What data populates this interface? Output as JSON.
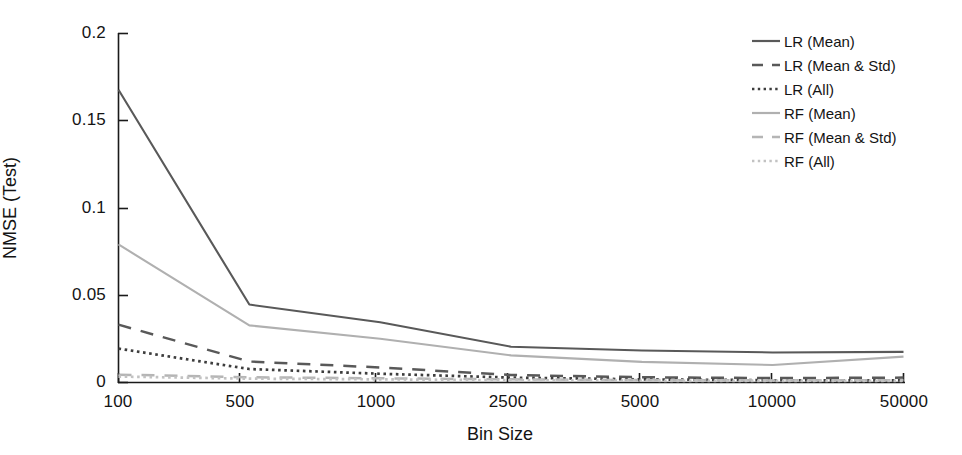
{
  "chart_data": {
    "type": "line",
    "title": "",
    "xlabel": "Bin Size",
    "ylabel": "NMSE (Test)",
    "x_categories": [
      "100",
      "500",
      "1000",
      "2500",
      "5000",
      "10000",
      "50000"
    ],
    "x_tick_labels": [
      "100",
      "500",
      "1000",
      "2500",
      "5000",
      "10000",
      "50000"
    ],
    "y_tick_labels": [
      "0",
      "0.05",
      "0.1",
      "0.15",
      "0.2"
    ],
    "y_tick_values": [
      0,
      0.05,
      0.1,
      0.15,
      0.2
    ],
    "ylim": [
      0,
      0.2
    ],
    "grid": false,
    "legend_position": "top-right",
    "series": [
      {
        "name": "LR (Mean)",
        "style": "solid",
        "color": "#595959",
        "values": [
          0.1675,
          0.0446,
          0.0345,
          0.0205,
          0.0183,
          0.0172,
          0.0175
        ]
      },
      {
        "name": "LR (Mean & Std)",
        "style": "dashed",
        "color": "#595959",
        "values": [
          0.0331,
          0.012,
          0.0086,
          0.0043,
          0.003,
          0.0025,
          0.0028
        ]
      },
      {
        "name": "LR (All)",
        "style": "dotted",
        "color": "#3d3d3d",
        "values": [
          0.0194,
          0.0077,
          0.005,
          0.0028,
          0.0018,
          0.0013,
          0.0012
        ]
      },
      {
        "name": "RF (Mean)",
        "style": "solid",
        "color": "#b0b0b0",
        "values": [
          0.079,
          0.0327,
          0.025,
          0.0155,
          0.0118,
          0.01,
          0.0148
        ]
      },
      {
        "name": "RF (Mean & Std)",
        "style": "dashed",
        "color": "#b5b5b5",
        "values": [
          0.0045,
          0.003,
          0.0024,
          0.0018,
          0.0014,
          0.0012,
          0.0013
        ]
      },
      {
        "name": "RF (All)",
        "style": "dotted",
        "color": "#c2c2c2",
        "values": [
          0.0034,
          0.0022,
          0.0018,
          0.0013,
          0.001,
          0.0009,
          0.0009
        ]
      }
    ]
  },
  "axes": {
    "ylabel": "NMSE (Test)",
    "xlabel": "Bin Size"
  },
  "legend": {
    "items": [
      {
        "label": "LR (Mean)"
      },
      {
        "label": "LR (Mean & Std)"
      },
      {
        "label": "LR (All)"
      },
      {
        "label": "RF (Mean)"
      },
      {
        "label": "RF (Mean & Std)"
      },
      {
        "label": "RF (All)"
      }
    ]
  },
  "ticks": {
    "y": [
      "0.2",
      "0.15",
      "0.1",
      "0.05",
      "0"
    ],
    "x": [
      "100",
      "500",
      "1000",
      "2500",
      "5000",
      "10000",
      "50000"
    ]
  }
}
